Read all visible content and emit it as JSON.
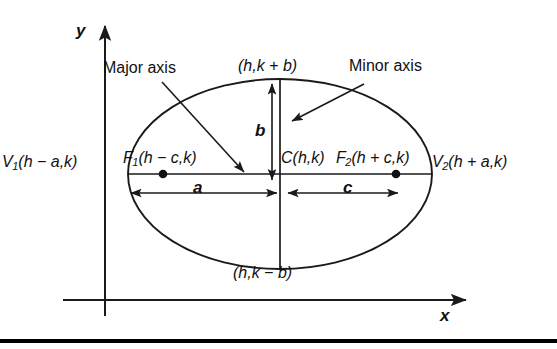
{
  "figure": {
    "kind": "ellipse-anatomy-diagram",
    "axes": {
      "x_label": "x",
      "y_label": "y"
    },
    "callouts": {
      "major_axis": "Major axis",
      "minor_axis": "Minor axis"
    },
    "points": {
      "center": {
        "symbol": "C",
        "coords": "(h,k)"
      },
      "vertex_left": {
        "symbol": "V",
        "sub": "1",
        "coords": "(h − a,k)"
      },
      "vertex_right": {
        "symbol": "V",
        "sub": "2",
        "coords": "(h + a,k)"
      },
      "focus_left": {
        "symbol": "F",
        "sub": "1",
        "coords": "(h − c,k)"
      },
      "focus_right": {
        "symbol": "F",
        "sub": "2",
        "coords": "(h + c,k)"
      },
      "co_vertex_top": {
        "coords": "(h,k + b)"
      },
      "co_vertex_bottom": {
        "coords": "(h,k − b)"
      }
    },
    "dimensions": {
      "semi_major": "a",
      "semi_minor": "b",
      "focal_distance": "c"
    },
    "colors": {
      "stroke": "#1a1a1a",
      "background": "#ffffff",
      "rule": "#000000"
    }
  }
}
